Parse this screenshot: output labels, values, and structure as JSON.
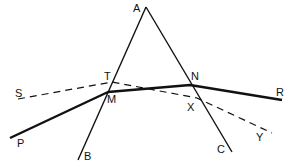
{
  "diagram": {
    "points": {
      "A": {
        "label": "A",
        "x": 146,
        "y": 7
      },
      "B": {
        "label": "B",
        "x": 78,
        "y": 160
      },
      "C": {
        "label": "C",
        "x": 232,
        "y": 152
      },
      "P": {
        "label": "P",
        "x": 10,
        "y": 138
      },
      "M": {
        "label": "M",
        "x": 108,
        "y": 92
      },
      "N": {
        "label": "N",
        "x": 190,
        "y": 85
      },
      "R": {
        "label": "R",
        "x": 282,
        "y": 100
      },
      "S": {
        "label": "S",
        "x": 18,
        "y": 99
      },
      "T": {
        "label": "T",
        "x": 112,
        "y": 82
      },
      "X": {
        "label": "X",
        "x": 197,
        "y": 98
      },
      "Y": {
        "label": "Y",
        "x": 272,
        "y": 133
      }
    },
    "labels": {
      "A": "A",
      "B": "B",
      "C": "C",
      "P": "P",
      "M": "M",
      "N": "N",
      "R": "R",
      "S": "S",
      "T": "T",
      "X": "X",
      "Y": "Y"
    },
    "lines": [
      {
        "name": "prism-side-AB",
        "from": "A",
        "to": "B",
        "style": "solid"
      },
      {
        "name": "prism-side-AC",
        "from": "A",
        "to": "C",
        "style": "solid"
      },
      {
        "name": "ray-path-PMNR",
        "path": [
          "P",
          "M",
          "N",
          "R"
        ],
        "style": "solid-thick"
      },
      {
        "name": "dashed-line-STXY",
        "path": [
          "S",
          "T",
          "X",
          "Y"
        ],
        "style": "dashed"
      }
    ],
    "colors": {
      "line": "#111111",
      "background": "#ffffff"
    }
  }
}
